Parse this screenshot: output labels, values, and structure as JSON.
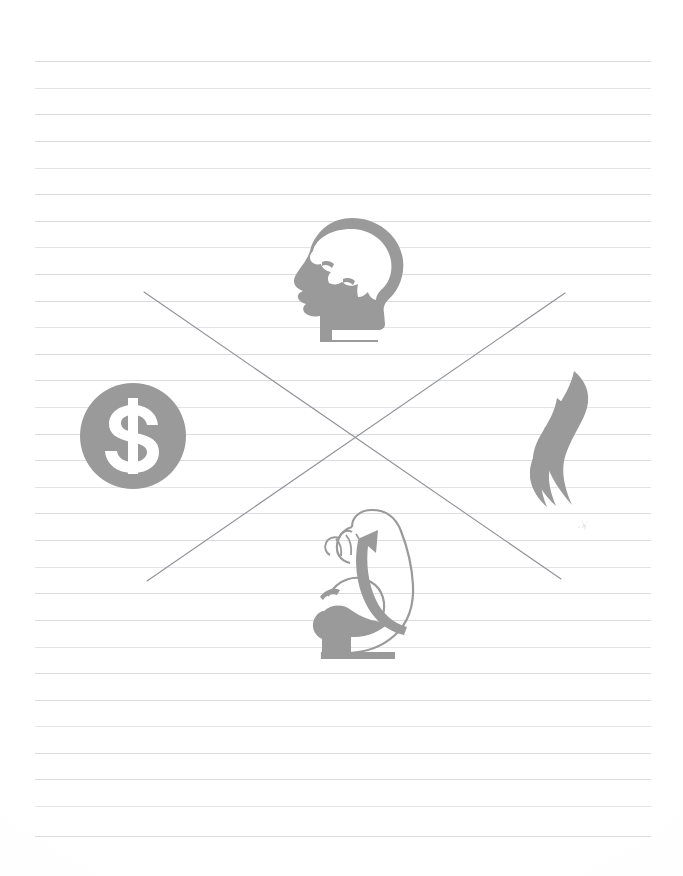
{
  "document": {
    "kind": "scanned-ruled-notebook-page",
    "page_width": 683,
    "page_height": 876,
    "background_color": "#ffffff",
    "has_visible_text": false,
    "text_content": ""
  },
  "ruled_paper": {
    "line_color": "#d9dade",
    "line_count": 30,
    "line_spacing_px": 26.6,
    "first_line_y": 61,
    "line_left_x": 35,
    "line_right_x": 651,
    "line_y_positions": [
      61,
      88,
      114,
      141,
      168,
      194,
      221,
      247,
      274,
      301,
      327,
      354,
      380,
      407,
      434,
      460,
      487,
      513,
      540,
      567,
      593,
      620,
      647,
      673,
      700,
      726,
      753,
      779,
      806,
      836
    ]
  },
  "icons": {
    "accent_color": "#9a9a9a",
    "stroke_color": "#9a9a9a",
    "items": [
      {
        "id": "head-brain",
        "name": "head-brain-icon",
        "label": "Head with brain",
        "meaning": "mind",
        "x": 292,
        "y": 216,
        "width": 116,
        "height": 126,
        "fill": "#9a9a9a"
      },
      {
        "id": "dollar-coin",
        "name": "dollar-sign-icon",
        "label": "Dollar sign in circle",
        "meaning": "money",
        "x": 79,
        "y": 382,
        "width": 108,
        "height": 108,
        "fill": "#9a9a9a",
        "symbol": "$",
        "symbol_color": "#ffffff"
      },
      {
        "id": "flame",
        "name": "flame-icon",
        "label": "Flame",
        "meaning": "energy",
        "x": 530,
        "y": 370,
        "width": 68,
        "height": 138,
        "fill": "#9a9a9a"
      },
      {
        "id": "flexed-bicep",
        "name": "flexed-bicep-icon",
        "label": "Flexed bicep arm",
        "meaning": "strength",
        "x": 300,
        "y": 505,
        "width": 128,
        "height": 155,
        "fill": "#9a9a9a"
      }
    ]
  },
  "strike_marks": {
    "color": "#8f9196",
    "stroke_width": 1.1,
    "description": "Large hand-drawn X crossing out all four icons",
    "lines": [
      {
        "name": "strike-line-down",
        "x1": 144,
        "y1": 292,
        "x2": 561,
        "y2": 579
      },
      {
        "name": "strike-line-up",
        "x1": 147,
        "y1": 581,
        "x2": 565,
        "y2": 293
      }
    ]
  },
  "artifacts": {
    "smudge": {
      "name": "scan-smudge",
      "x": 575,
      "y": 518,
      "color": "#c9cacd"
    }
  }
}
